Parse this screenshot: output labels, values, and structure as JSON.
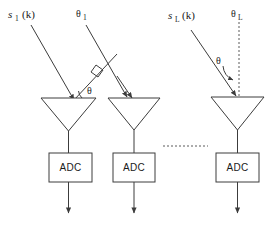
{
  "figure": {
    "background_color": "#ffffff",
    "line_color": "#3c3c3c",
    "text_color": "#1a1a1a"
  },
  "labels": {
    "signal_1": {
      "base": "s",
      "sub": "1",
      "arg": "(k)"
    },
    "signal_L": {
      "base": "s",
      "sub": "L",
      "arg": "(k)"
    },
    "angle_1": {
      "base": "θ",
      "sub": "1"
    },
    "angle_L": {
      "base": "θ",
      "sub": "L"
    },
    "angle_left": "θ",
    "angle_right": "θ"
  },
  "channels": [
    {
      "id": "channel-1",
      "adc_label": "ADC",
      "has_signal_arrow": true,
      "has_angle_ref": true
    },
    {
      "id": "channel-2",
      "adc_label": "ADC",
      "has_signal_arrow": true,
      "has_angle_ref": false
    },
    {
      "id": "channel-L",
      "adc_label": "ADC",
      "has_signal_arrow": true,
      "has_angle_ref": true
    }
  ],
  "ellipsis": {
    "style": "dashed-horizontal",
    "meaning": "additional channels omitted"
  },
  "markers": {
    "right_angle": "perpendicular-square",
    "arc_left": "angle-arc",
    "arc_right": "angle-arc"
  }
}
